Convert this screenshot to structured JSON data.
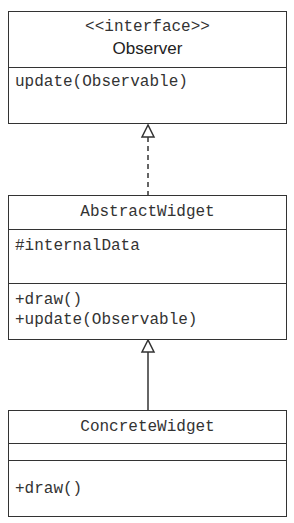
{
  "diagram": {
    "type": "uml-class-diagram",
    "classes": [
      {
        "id": "observer",
        "stereotype": "<<interface>>",
        "name": "Observer",
        "attributes": [],
        "operations": [
          "update(Observable)"
        ]
      },
      {
        "id": "abstract_widget",
        "name": "AbstractWidget",
        "attributes": [
          "#internalData"
        ],
        "operations": [
          "+draw()",
          "+update(Observable)"
        ]
      },
      {
        "id": "concrete_widget",
        "name": "ConcreteWidget",
        "attributes": [],
        "operations": [
          "+draw()"
        ]
      }
    ],
    "relations": [
      {
        "from": "AbstractWidget",
        "to": "Observer",
        "kind": "realization",
        "style": "dashed",
        "arrow": "hollow-triangle"
      },
      {
        "from": "ConcreteWidget",
        "to": "AbstractWidget",
        "kind": "generalization",
        "style": "solid",
        "arrow": "hollow-triangle"
      }
    ]
  },
  "colors": {
    "line": "#333333",
    "background": "#ffffff"
  }
}
